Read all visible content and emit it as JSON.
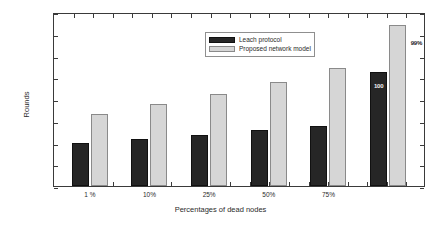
{
  "chart_data": {
    "type": "bar",
    "title": "",
    "xlabel": "Percentages of dead nodes",
    "ylabel": "Rounds",
    "categories": [
      "1 %",
      "10%",
      "25%",
      "50%",
      "75%",
      ""
    ],
    "series": [
      {
        "name": "Leach protocol",
        "color": "#262626",
        "values": [
          990,
          1090,
          1170,
          1280,
          1370,
          2620
        ]
      },
      {
        "name": "Proposed network model",
        "color": "#d6d6d6",
        "values": [
          1650,
          1880,
          2120,
          2380,
          2720,
          3700
        ]
      }
    ],
    "ylim": [
      0,
      4000
    ],
    "yticks": [
      0,
      500,
      1000,
      1500,
      2000,
      2500,
      3000,
      3500,
      4000
    ],
    "ytick_labels": [
      "0",
      "500",
      "1000",
      "1500",
      "2000",
      "2500",
      "3000",
      "3500",
      "4000"
    ],
    "grid": false,
    "legend_position": "top-center",
    "annotations": [
      {
        "text": "100",
        "series": "Leach protocol",
        "category_index": 5,
        "placement": "inside-top"
      },
      {
        "text": "99%",
        "series": "Proposed network model",
        "category_index": 5,
        "placement": "outside-right"
      }
    ]
  },
  "legend": {
    "entries": [
      {
        "label": "Leach protocol"
      },
      {
        "label": "Proposed network model"
      }
    ]
  }
}
